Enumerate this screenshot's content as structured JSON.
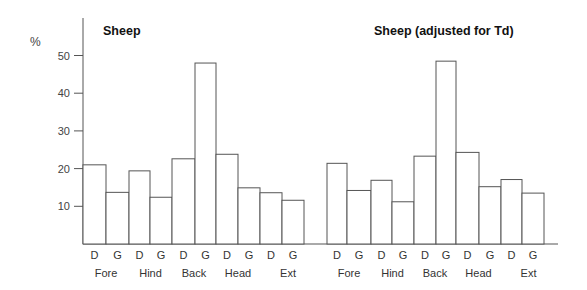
{
  "figure": {
    "y_unit_label": "%",
    "y_ticks": [
      10,
      20,
      30,
      40,
      50
    ]
  },
  "chart_data": [
    {
      "type": "bar",
      "title": "Sheep",
      "xlabel": "",
      "ylabel": "%",
      "ylim": [
        0,
        58
      ],
      "grid": false,
      "legend": null,
      "groups": [
        "Fore",
        "Hind",
        "Back",
        "Head",
        "Ext"
      ],
      "categories": [
        "D",
        "G",
        "D",
        "G",
        "D",
        "G",
        "D",
        "G",
        "D",
        "G"
      ],
      "series": [
        {
          "name": "D",
          "values": [
            21.0,
            19.4,
            22.6,
            23.8,
            13.6
          ]
        },
        {
          "name": "G",
          "values": [
            13.7,
            12.4,
            48.0,
            14.9,
            11.6
          ]
        }
      ],
      "values": [
        21.0,
        13.7,
        19.4,
        12.4,
        22.6,
        48.0,
        23.8,
        14.9,
        13.6,
        11.6
      ]
    },
    {
      "type": "bar",
      "title": "Sheep (adjusted for Td)",
      "xlabel": "",
      "ylabel": "%",
      "ylim": [
        0,
        58
      ],
      "grid": false,
      "legend": null,
      "groups": [
        "Fore",
        "Hind",
        "Back",
        "Head",
        "Ext"
      ],
      "categories": [
        "D",
        "G",
        "D",
        "G",
        "D",
        "G",
        "D",
        "G",
        "D",
        "G"
      ],
      "series": [
        {
          "name": "D",
          "values": [
            21.4,
            16.9,
            23.3,
            24.3,
            17.1
          ]
        },
        {
          "name": "G",
          "values": [
            14.2,
            11.2,
            48.5,
            15.2,
            13.5
          ]
        }
      ],
      "values": [
        21.4,
        14.2,
        16.9,
        11.2,
        23.3,
        48.5,
        24.3,
        15.2,
        17.1,
        13.5
      ]
    }
  ]
}
